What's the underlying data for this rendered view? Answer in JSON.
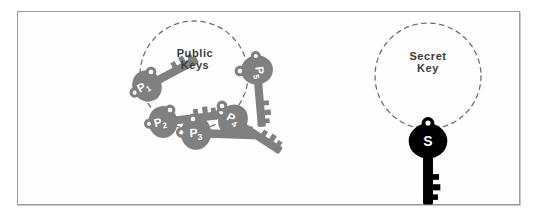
{
  "figure": {
    "background_color": "#ffffff",
    "frame_color": "#9a9a9a",
    "key_gray": "#808080",
    "key_black": "#000000",
    "dash_color": "#6f6f6f",
    "text_color": "#3a3a3a"
  },
  "groups": [
    {
      "id": "public",
      "label_line1": "Public",
      "label_line2": "Keys",
      "label_text": "Public\nKeys",
      "circle": {
        "cx": 194,
        "cy": 75,
        "r": 54
      }
    },
    {
      "id": "secret",
      "label_line1": "Secret",
      "label_line2": "Key",
      "label_text": "Secret\nKey",
      "circle": {
        "cx": 428,
        "cy": 76,
        "r": 53
      }
    }
  ],
  "keys": [
    {
      "id": "p1",
      "label": "P",
      "subscript": "1",
      "color": "#808080",
      "ring_x": 147,
      "ring_y": 86,
      "angle": -118,
      "bow_label": "P1"
    },
    {
      "id": "p2",
      "label": "P",
      "subscript": "2",
      "color": "#808080",
      "ring_x": 161,
      "ring_y": 116,
      "angle": -100,
      "bow_label": "P2"
    },
    {
      "id": "p3",
      "label": "P",
      "subscript": "3",
      "color": "#808080",
      "ring_x": 194,
      "ring_y": 129,
      "angle": -90,
      "bow_label": "P3"
    },
    {
      "id": "p4",
      "label": "P",
      "subscript": "4",
      "color": "#808080",
      "ring_x": 228,
      "ring_y": 117,
      "angle": -58,
      "bow_label": "P4"
    },
    {
      "id": "p5",
      "label": "P",
      "subscript": "5",
      "color": "#808080",
      "ring_x": 242,
      "ring_y": 72,
      "angle": -4,
      "bow_label": "P5"
    },
    {
      "id": "s",
      "label": "S",
      "subscript": "",
      "color": "#000000",
      "ring_x": 428,
      "ring_y": 129,
      "angle": -90,
      "bow_label": "S"
    }
  ]
}
